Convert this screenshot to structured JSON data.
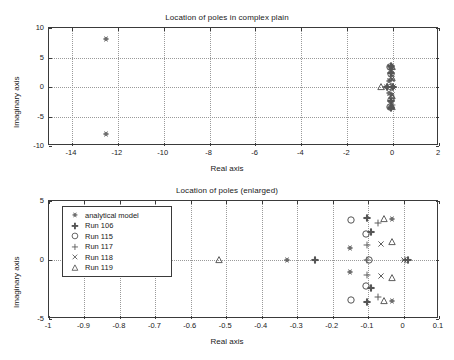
{
  "figure": {
    "width": 454,
    "height": 360,
    "background": "#ffffff",
    "axis_color": "#3a3a3a",
    "grid_color": "#9a9a9a",
    "marker_color": "#555555"
  },
  "chart_data": [
    {
      "id": "top",
      "type": "scatter",
      "title": "Location of poles in complex plain",
      "xlabel": "Real axis",
      "ylabel": "Imaginary axis",
      "xlim": [
        -15,
        2
      ],
      "ylim": [
        -10,
        10
      ],
      "xticks": [
        -14,
        -12,
        -10,
        -8,
        -6,
        -4,
        -2,
        0,
        2
      ],
      "xticklabels": [
        "-14",
        "-12",
        "-10",
        "-8",
        "-6",
        "-4",
        "-2",
        "0",
        "2"
      ],
      "yticks": [
        -10,
        -5,
        0,
        5,
        10
      ],
      "yticklabels": [
        "-10",
        "-5",
        "0",
        "5",
        "10"
      ],
      "grid": true,
      "legend": null,
      "series": [
        {
          "name": "analytical model",
          "marker": "hexagram",
          "points": [
            [
              -12.5,
              8.1
            ],
            [
              -12.5,
              -8.0
            ],
            [
              -0.15,
              3.4
            ],
            [
              -0.15,
              -3.4
            ],
            [
              -0.11,
              2.3
            ],
            [
              -0.11,
              -2.3
            ],
            [
              -0.16,
              1.0
            ],
            [
              -0.16,
              -1.0
            ],
            [
              -0.03,
              3.4
            ],
            [
              -0.03,
              -3.4
            ],
            [
              -0.33,
              0.0
            ]
          ]
        },
        {
          "name": "Run 106",
          "marker": "plus-bold",
          "points": [
            [
              -0.1,
              3.6
            ],
            [
              -0.1,
              -3.6
            ],
            [
              -0.09,
              2.4
            ],
            [
              -0.09,
              -2.4
            ],
            [
              -0.25,
              0.0
            ],
            [
              0.01,
              0.0
            ]
          ]
        },
        {
          "name": "Run 115",
          "marker": "circle-large",
          "points": [
            [
              -0.15,
              3.4
            ],
            [
              -0.15,
              -3.4
            ],
            [
              -0.11,
              2.2
            ],
            [
              -0.11,
              -2.2
            ],
            [
              -0.095,
              0.0
            ]
          ]
        },
        {
          "name": "Run 117",
          "marker": "plus",
          "points": [
            [
              -0.07,
              3.1
            ],
            [
              -0.07,
              -3.1
            ],
            [
              -0.1,
              1.3
            ],
            [
              -0.1,
              -1.3
            ],
            [
              -0.1,
              0.0
            ],
            [
              0.005,
              0.0
            ]
          ]
        },
        {
          "name": "Run 118",
          "marker": "cross",
          "points": [
            [
              -0.065,
              1.3
            ],
            [
              -0.065,
              -1.3
            ],
            [
              0.0,
              0.0
            ]
          ]
        },
        {
          "name": "Run 119",
          "marker": "triangle",
          "points": [
            [
              -0.055,
              3.45
            ],
            [
              -0.055,
              -3.45
            ],
            [
              -0.035,
              1.5
            ],
            [
              -0.035,
              -1.5
            ],
            [
              -0.52,
              0.0
            ]
          ]
        }
      ]
    },
    {
      "id": "bottom",
      "type": "scatter",
      "title": "Location of poles (enlarged)",
      "xlabel": "Real axis",
      "ylabel": "Imaginary axis",
      "xlim": [
        -1,
        0.1
      ],
      "ylim": [
        -5,
        5
      ],
      "xticks": [
        -1,
        -0.9,
        -0.8,
        -0.7,
        -0.6,
        -0.5,
        -0.4,
        -0.3,
        -0.2,
        -0.1,
        0,
        0.1
      ],
      "xticklabels": [
        "-1",
        "-0.9",
        "-0.8",
        "-0.7",
        "-0.6",
        "-0.5",
        "-0.4",
        "-0.3",
        "-0.2",
        "-0.1",
        "0",
        "0.1"
      ],
      "yticks": [
        -5,
        0,
        5
      ],
      "yticklabels": [
        "-5",
        "0",
        "5"
      ],
      "grid": true,
      "legend": {
        "position": "upper-left",
        "entries": [
          {
            "label": "analytical model",
            "marker": "hexagram"
          },
          {
            "label": "Run 106",
            "marker": "plus-bold"
          },
          {
            "label": "Run 115",
            "marker": "circle-large"
          },
          {
            "label": "Run 117",
            "marker": "plus"
          },
          {
            "label": "Run 118",
            "marker": "cross"
          },
          {
            "label": "Run 119",
            "marker": "triangle"
          }
        ]
      },
      "series": [
        {
          "name": "analytical model",
          "marker": "hexagram",
          "points": [
            [
              -0.033,
              3.45
            ],
            [
              -0.033,
              -3.45
            ],
            [
              -0.152,
              1.0
            ],
            [
              -0.152,
              -1.0
            ],
            [
              -0.33,
              0.0
            ]
          ]
        },
        {
          "name": "Run 106",
          "marker": "plus-bold",
          "points": [
            [
              -0.103,
              3.6
            ],
            [
              -0.103,
              -3.6
            ],
            [
              -0.093,
              2.4
            ],
            [
              -0.093,
              -2.4
            ],
            [
              -0.25,
              0.0
            ],
            [
              0.012,
              0.0
            ]
          ]
        },
        {
          "name": "Run 115",
          "marker": "circle-large",
          "points": [
            [
              -0.148,
              3.4
            ],
            [
              -0.148,
              -3.4
            ],
            [
              -0.107,
              2.2
            ],
            [
              -0.107,
              -2.2
            ],
            [
              -0.097,
              0.0
            ]
          ]
        },
        {
          "name": "Run 117",
          "marker": "plus",
          "points": [
            [
              -0.072,
              3.1
            ],
            [
              -0.072,
              -3.1
            ],
            [
              -0.103,
              1.3
            ],
            [
              -0.103,
              -1.3
            ],
            [
              -0.103,
              0.0
            ],
            [
              0.004,
              0.0
            ]
          ]
        },
        {
          "name": "Run 118",
          "marker": "cross",
          "points": [
            [
              -0.063,
              1.35
            ],
            [
              -0.063,
              -1.35
            ],
            [
              0.0,
              0.0
            ]
          ]
        },
        {
          "name": "Run 119",
          "marker": "triangle",
          "points": [
            [
              -0.055,
              3.45
            ],
            [
              -0.055,
              -3.45
            ],
            [
              -0.033,
              1.5
            ],
            [
              -0.033,
              -1.5
            ],
            [
              -0.52,
              0.0
            ]
          ]
        }
      ]
    }
  ]
}
